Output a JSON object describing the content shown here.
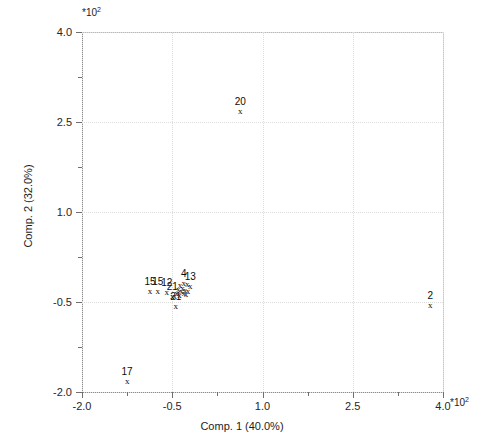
{
  "chart_data": {
    "type": "scatter",
    "title": "",
    "xlabel": "Comp. 1 (40.0%)",
    "ylabel": "Comp. 2 (32.0%)",
    "x_multiplier": "*10",
    "x_multiplier_exp": "2",
    "y_multiplier": "*10",
    "y_multiplier_exp": "2",
    "xlim": [
      -2.0,
      4.0
    ],
    "ylim": [
      -2.0,
      4.0
    ],
    "xticks": [
      "-2.0",
      "-0.5",
      "1.0",
      "2.5",
      "4.0"
    ],
    "xtick_values": [
      -2.0,
      -0.5,
      1.0,
      2.5,
      4.0
    ],
    "yticks": [
      "4.0",
      "2.5",
      "1.0",
      "-0.5",
      "-2.0"
    ],
    "ytick_values": [
      4.0,
      2.5,
      1.0,
      -0.5,
      -2.0
    ],
    "x_minor_ticks": [
      -1.25,
      0.25,
      1.75,
      3.25
    ],
    "y_minor_ticks": [
      3.25,
      1.75,
      0.25,
      -1.25
    ],
    "grid": true,
    "legend": "none",
    "marker": "x",
    "points": [
      {
        "label": "20",
        "x": 0.63,
        "y": 2.67
      },
      {
        "label": "2",
        "x": 3.79,
        "y": -0.56
      },
      {
        "label": "17",
        "x": -1.25,
        "y": -1.83
      },
      {
        "label": "21",
        "x": -0.44,
        "y": -0.58
      },
      {
        "label": "15",
        "x": -0.87,
        "y": -0.33
      },
      {
        "label": "15",
        "x": -0.74,
        "y": -0.33
      },
      {
        "label": "12",
        "x": -0.59,
        "y": -0.35
      },
      {
        "label": "21",
        "x": -0.5,
        "y": -0.42
      },
      {
        "label": "4",
        "x": -0.31,
        "y": -0.2
      },
      {
        "label": "13",
        "x": -0.2,
        "y": -0.25
      },
      {
        "label": "",
        "x": -0.37,
        "y": -0.24
      },
      {
        "label": "",
        "x": -0.33,
        "y": -0.28
      },
      {
        "label": "",
        "x": -0.29,
        "y": -0.31
      },
      {
        "label": "",
        "x": -0.35,
        "y": -0.33
      },
      {
        "label": "",
        "x": -0.31,
        "y": -0.36
      },
      {
        "label": "",
        "x": -0.27,
        "y": -0.38
      },
      {
        "label": "",
        "x": -0.4,
        "y": -0.3
      },
      {
        "label": "",
        "x": -0.43,
        "y": -0.36
      },
      {
        "label": "",
        "x": -0.25,
        "y": -0.22
      },
      {
        "label": "",
        "x": -0.24,
        "y": -0.34
      },
      {
        "label": "",
        "x": -0.38,
        "y": -0.4
      },
      {
        "label": "",
        "x": -0.46,
        "y": -0.41
      }
    ]
  }
}
